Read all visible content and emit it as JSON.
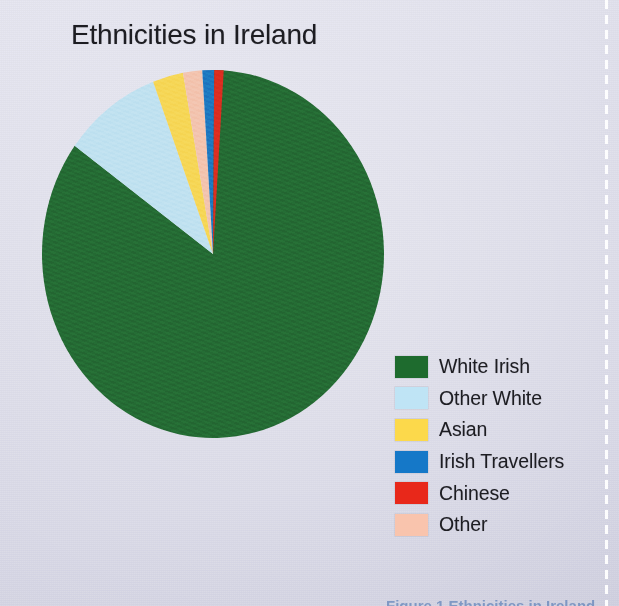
{
  "chart_data": {
    "type": "pie",
    "title": "Ethnicities in Ireland",
    "xlabel": "",
    "ylabel": "",
    "legend_position": "right",
    "grid": false,
    "start_angle_deg": 0,
    "direction": "clockwise",
    "categories": [
      "White Irish",
      "Other White",
      "Asian",
      "Irish Travellers",
      "Chinese",
      "Other"
    ],
    "values": [
      85.0,
      9.3,
      2.9,
      1.1,
      0.9,
      1.8
    ],
    "colors": [
      "#1e6b2e",
      "#bfe4f5",
      "#fcd94b",
      "#1578c8",
      "#e8281a",
      "#f9c4ad"
    ],
    "slices": [
      {
        "label": "White Irish",
        "value": 85.0,
        "color": "#1e6b2e",
        "start_deg": 0.0,
        "end_deg": 306.0
      },
      {
        "label": "Other White",
        "value": 9.3,
        "color": "#bfe4f5",
        "start_deg": 306.0,
        "end_deg": 339.5
      },
      {
        "label": "Asian",
        "value": 2.9,
        "color": "#fcd94b",
        "start_deg": 339.5,
        "end_deg": 349.9
      },
      {
        "label": "Other",
        "value": 1.8,
        "color": "#f9c4ad",
        "start_deg": 349.9,
        "end_deg": 356.4
      },
      {
        "label": "Irish Travellers",
        "value": 1.1,
        "color": "#1578c8",
        "start_deg": 356.4,
        "end_deg": 360.4
      },
      {
        "label": "Chinese",
        "value": 0.9,
        "color": "#e8281a",
        "start_deg": 360.4,
        "end_deg": 363.6
      }
    ]
  },
  "title": {
    "text": "Ethnicities in Ireland"
  },
  "legend": {
    "items": [
      {
        "label": "White Irish",
        "color": "#1e6b2e"
      },
      {
        "label": "Other White",
        "color": "#bfe4f5"
      },
      {
        "label": "Asian",
        "color": "#fcd94b"
      },
      {
        "label": "Irish Travellers",
        "color": "#1578c8"
      },
      {
        "label": "Chinese",
        "color": "#e8281a"
      },
      {
        "label": "Other",
        "color": "#f9c4ad"
      }
    ]
  },
  "bottom_caption": {
    "text": "Figure 1 Ethnicities in Ireland"
  }
}
